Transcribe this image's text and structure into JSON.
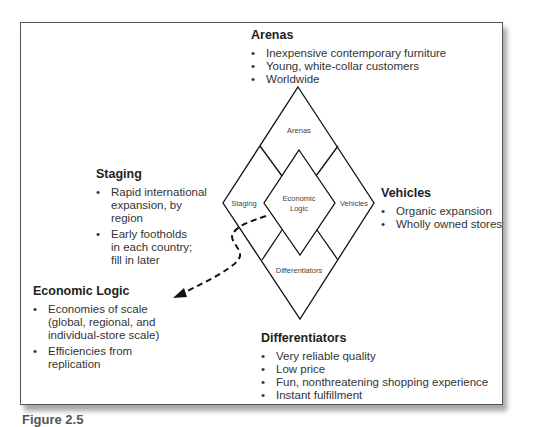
{
  "diagram": {
    "center_labels": {
      "arenas": "Arenas",
      "staging": "Staging",
      "vehicles": "Vehicles",
      "economic_logic_line1": "Economic",
      "economic_logic_line2": "Logic",
      "differentiators": "Differentiators"
    },
    "arenas": {
      "title": "Arenas",
      "items": [
        "Inexpensive contemporary furniture",
        "Young, white-collar customers",
        "Worldwide"
      ]
    },
    "staging": {
      "title": "Staging",
      "items": [
        "Rapid international expansion, by region",
        "Early footholds in each country; fill in later"
      ]
    },
    "vehicles": {
      "title": "Vehicles",
      "items": [
        "Organic expansion",
        "Wholly owned stores"
      ]
    },
    "economic_logic": {
      "title": "Economic Logic",
      "items": [
        "Economies of scale (global, regional, and individual-store scale)",
        "Efficiencies from replication"
      ]
    },
    "differentiators": {
      "title": "Differentiators",
      "items": [
        "Very reliable quality",
        "Low price",
        "Fun, nonthreatening shopping experience",
        "Instant fulfillment"
      ]
    },
    "caption": "Figure 2.5"
  }
}
